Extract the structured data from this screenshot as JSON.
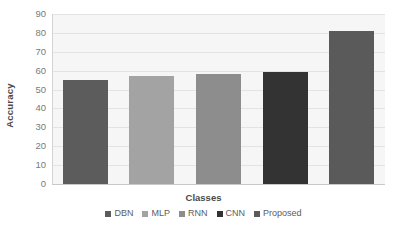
{
  "chart_data": {
    "type": "bar",
    "title": "",
    "subtitle": "",
    "xlabel": "Classes",
    "ylabel": "Accuracy",
    "categories": [
      "DBN",
      "MLP",
      "RNN",
      "CNN",
      "Proposed"
    ],
    "values": [
      55,
      57,
      58,
      59.5,
      81
    ],
    "series": [
      {
        "name": "Accuracy",
        "values": [
          55,
          57,
          58,
          59.5,
          81
        ]
      }
    ],
    "bar_colors": [
      "#5c5c5c",
      "#a3a3a3",
      "#8d8d8d",
      "#333333",
      "#5a5a5a"
    ],
    "ylim": [
      0,
      90
    ],
    "yticks": [
      0,
      10,
      20,
      30,
      40,
      50,
      60,
      70,
      80,
      90
    ],
    "ytick_labels": [
      "0",
      "10",
      "20",
      "30",
      "40",
      "50",
      "60",
      "70",
      "80",
      "90"
    ],
    "xticks": [],
    "xtick_labels": [],
    "grid": true,
    "grid_axis": "y",
    "legend_position": "bottom",
    "legend_entries": [
      {
        "label": "DBN",
        "color": "#5c5c5c"
      },
      {
        "label": "MLP",
        "color": "#a3a3a3"
      },
      {
        "label": "RNN",
        "color": "#8d8d8d"
      },
      {
        "label": "CNN",
        "color": "#333333"
      },
      {
        "label": "Proposed",
        "color": "#5a5a5a"
      }
    ],
    "plot_background": "#f6f6f6",
    "gridline_color": "#e3e3e3",
    "annotations": []
  }
}
